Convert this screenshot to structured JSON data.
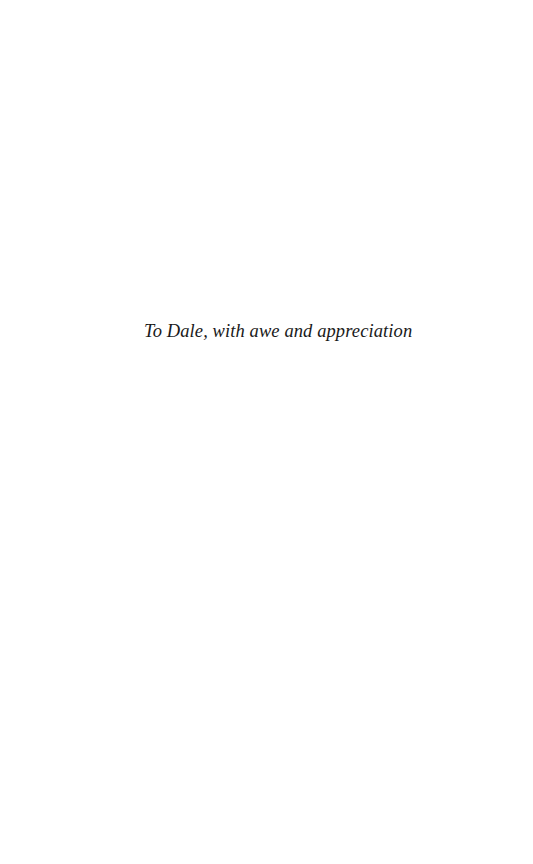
{
  "page": {
    "dedication": "To Dale, with awe and appreciation"
  }
}
